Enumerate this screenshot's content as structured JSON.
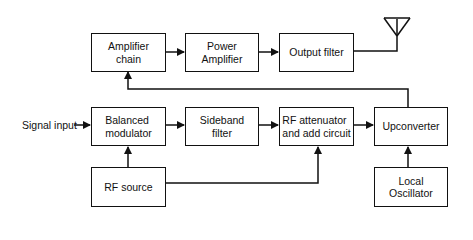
{
  "diagram": {
    "type": "block-diagram",
    "title": "",
    "blocks": {
      "amplifier_chain": "Amplifier\nchain",
      "power_amplifier": "Power\nAmplifier",
      "output_filter": "Output filter",
      "balanced_modulator": "Balanced\nmodulator",
      "sideband_filter": "Sideband\nfilter",
      "rf_attenuator": "RF attenuator\nand add circuit",
      "upconverter": "Upconverter",
      "rf_source": "RF source",
      "local_oscillator": "Local\nOscillator"
    },
    "input_label": "Signal input",
    "connections": [
      {
        "from": "Signal input",
        "to": "Balanced modulator"
      },
      {
        "from": "Balanced modulator",
        "to": "Sideband filter"
      },
      {
        "from": "Sideband filter",
        "to": "RF attenuator and add circuit"
      },
      {
        "from": "RF attenuator and add circuit",
        "to": "Upconverter"
      },
      {
        "from": "RF source",
        "to": "Balanced modulator"
      },
      {
        "from": "RF source",
        "to": "RF attenuator and add circuit"
      },
      {
        "from": "Local Oscillator",
        "to": "Upconverter"
      },
      {
        "from": "Upconverter",
        "to": "Amplifier chain"
      },
      {
        "from": "Amplifier chain",
        "to": "Power Amplifier"
      },
      {
        "from": "Power Amplifier",
        "to": "Output filter"
      },
      {
        "from": "Output filter",
        "to": "Antenna"
      }
    ]
  }
}
